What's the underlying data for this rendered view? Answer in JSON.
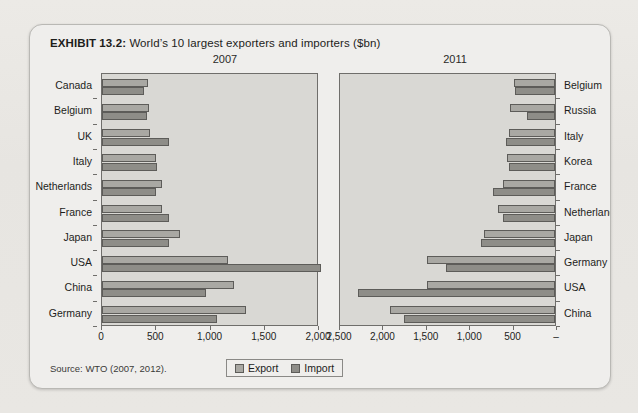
{
  "exhibit": {
    "number": "EXHIBIT 13.2:",
    "caption": "World’s 10 largest exporters and importers ($bn)",
    "source": "Source: WTO (2007, 2012)."
  },
  "legend": {
    "export_label": "Export",
    "import_label": "Import",
    "export_color": "#a9a8a3",
    "import_color": "#8e8d88"
  },
  "background_text": [
    "erkets",
    "regulates the flow of goods in a partic",
    "international import/export",
    "icense of exporting/importing",
    "porting and licensing is",
    "which may lead to gener",
    "al with compet",
    "tiffs, with",
    "plendid"
  ],
  "chart_data": [
    {
      "type": "bar",
      "title": "2007",
      "orientation": "horizontal",
      "xlabel": "",
      "ylabel": "",
      "xlim": [
        0,
        2000
      ],
      "xticks": [
        0,
        500,
        1000,
        1500,
        2000
      ],
      "xticklabels": [
        "0",
        "500",
        "1,000",
        "1,500",
        "2,000"
      ],
      "reversed_axis": false,
      "grid": false,
      "legend_position": "bottom-center",
      "categories": [
        "Canada",
        "Belgium",
        "UK",
        "Italy",
        "Netherlands",
        "France",
        "Japan",
        "USA",
        "China",
        "Germany"
      ],
      "series": [
        {
          "name": "Export",
          "values": [
            420,
            430,
            440,
            500,
            550,
            550,
            715,
            1160,
            1220,
            1330
          ]
        },
        {
          "name": "Import",
          "values": [
            390,
            415,
            620,
            505,
            495,
            615,
            620,
            2020,
            955,
            1060
          ]
        }
      ]
    },
    {
      "type": "bar",
      "title": "2011",
      "orientation": "horizontal",
      "xlabel": "",
      "ylabel": "",
      "xlim": [
        0,
        2500
      ],
      "xticks": [
        2500,
        2000,
        1500,
        1000,
        500,
        0
      ],
      "xticklabels": [
        "2,500",
        "2,000",
        "1,500",
        "1,000",
        "500",
        "–"
      ],
      "reversed_axis": true,
      "grid": false,
      "legend_position": "bottom-center",
      "categories": [
        "Belgium",
        "Russia",
        "Italy",
        "Korea",
        "France",
        "Netherlands",
        "Japan",
        "Germany",
        "USA",
        "China"
      ],
      "series": [
        {
          "name": "Export",
          "values": [
            475,
            520,
            525,
            555,
            595,
            660,
            823,
            1475,
            1480,
            1900
          ]
        },
        {
          "name": "Import",
          "values": [
            460,
            325,
            560,
            525,
            715,
            595,
            855,
            1255,
            2265,
            1740
          ]
        }
      ]
    }
  ]
}
